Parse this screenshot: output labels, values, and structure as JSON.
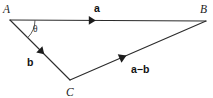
{
  "diagram": {
    "type": "vector-triangle",
    "canvas": {
      "width": 213,
      "height": 98,
      "background": "#ffffff"
    },
    "stroke_color": "#2b2b2b",
    "label_color": "#1c1c1c",
    "vertices": [
      {
        "id": "A",
        "label": "A",
        "x": 10,
        "y": 20,
        "label_x": 3,
        "label_y": 13
      },
      {
        "id": "B",
        "label": "B",
        "x": 206,
        "y": 21,
        "label_x": 200,
        "label_y": 13
      },
      {
        "id": "C",
        "label": "C",
        "x": 70,
        "y": 80,
        "label_x": 66,
        "label_y": 96
      }
    ],
    "edges": [
      {
        "id": "AB",
        "from": "A",
        "to": "B",
        "x1": 10,
        "y1": 20,
        "x2": 206,
        "y2": 21,
        "arrow_at": 0.42,
        "vector_label": "a",
        "label_x": 94,
        "label_y": 12
      },
      {
        "id": "AC",
        "from": "A",
        "to": "C",
        "x1": 10,
        "y1": 20,
        "x2": 70,
        "y2": 80,
        "arrow_at": 0.53,
        "vector_label": "b",
        "label_x": 27,
        "label_y": 66
      },
      {
        "id": "CB",
        "from": "C",
        "to": "B",
        "x1": 70,
        "y1": 80,
        "x2": 206,
        "y2": 21,
        "arrow_at": 0.39,
        "vector_label": "a−b",
        "label_x": 131,
        "label_y": 73
      }
    ],
    "angle": {
      "id": "theta-at-A",
      "label": "θ",
      "at_vertex": "A",
      "radius": 25,
      "label_x": 33,
      "label_y": 32
    }
  }
}
